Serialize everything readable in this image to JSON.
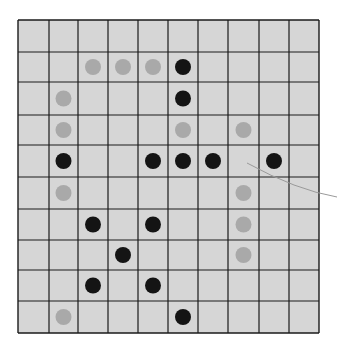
{
  "board": {
    "rows": 10,
    "cols": 10,
    "x_lines": [
      18,
      49,
      78,
      108,
      138,
      168,
      198,
      228,
      259,
      289,
      319
    ],
    "y_lines": [
      20,
      52,
      82,
      115,
      145,
      177,
      209,
      240,
      270,
      301,
      333
    ],
    "colors": {
      "background": "#ffffff",
      "board_fill": "#d6d6d6",
      "grid_line": "#1a1a1a",
      "black_stone": "#141414",
      "gray_stone": "#a9a9a9",
      "arrow": "#9a9a9a"
    }
  },
  "stones": [
    {
      "row": 1,
      "col": 2,
      "color": "gray"
    },
    {
      "row": 1,
      "col": 3,
      "color": "gray"
    },
    {
      "row": 1,
      "col": 4,
      "color": "gray"
    },
    {
      "row": 1,
      "col": 5,
      "color": "black"
    },
    {
      "row": 2,
      "col": 1,
      "color": "gray"
    },
    {
      "row": 2,
      "col": 5,
      "color": "black"
    },
    {
      "row": 3,
      "col": 1,
      "color": "gray"
    },
    {
      "row": 3,
      "col": 5,
      "color": "gray"
    },
    {
      "row": 3,
      "col": 7,
      "color": "gray"
    },
    {
      "row": 4,
      "col": 1,
      "color": "black"
    },
    {
      "row": 4,
      "col": 4,
      "color": "black"
    },
    {
      "row": 4,
      "col": 5,
      "color": "black"
    },
    {
      "row": 4,
      "col": 6,
      "color": "black"
    },
    {
      "row": 4,
      "col": 8,
      "color": "black"
    },
    {
      "row": 5,
      "col": 1,
      "color": "gray"
    },
    {
      "row": 5,
      "col": 7,
      "color": "gray"
    },
    {
      "row": 6,
      "col": 2,
      "color": "black"
    },
    {
      "row": 6,
      "col": 4,
      "color": "black"
    },
    {
      "row": 6,
      "col": 7,
      "color": "gray"
    },
    {
      "row": 7,
      "col": 3,
      "color": "black"
    },
    {
      "row": 7,
      "col": 7,
      "color": "gray"
    },
    {
      "row": 8,
      "col": 2,
      "color": "black"
    },
    {
      "row": 8,
      "col": 4,
      "color": "black"
    },
    {
      "row": 9,
      "col": 1,
      "color": "gray"
    },
    {
      "row": 9,
      "col": 5,
      "color": "black"
    }
  ],
  "annotations": [
    {
      "type": "arrow-line",
      "from": [
        337,
        197
      ],
      "to": [
        247,
        163
      ],
      "points_to": {
        "row": 4,
        "col": 7
      }
    }
  ]
}
